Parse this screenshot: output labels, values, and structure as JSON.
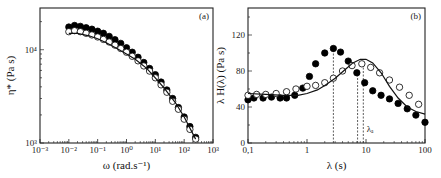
{
  "chart_data": [
    {
      "type": "scatter",
      "panel_label": "(a)",
      "xlabel": "ω (rad.s⁻¹)",
      "ylabel": "η* (Pa s)",
      "xscale": "log",
      "yscale": "log",
      "xlim": [
        0.001,
        1000
      ],
      "ylim": [
        1000,
        28000
      ],
      "x_ticks": [
        "10⁻³",
        "10⁻²",
        "10⁻¹",
        "10⁰",
        "10¹",
        "10²",
        "10³"
      ],
      "y_ticks": [
        "10³",
        "10⁴"
      ],
      "series": [
        {
          "name": "filled circles",
          "marker": "filled-circle",
          "x": [
            0.01,
            0.0158,
            0.0251,
            0.0398,
            0.0631,
            0.1,
            0.158,
            0.251,
            0.398,
            0.631,
            1,
            1.58,
            2.51,
            3.98,
            6.31,
            10,
            15.8,
            25.1,
            39.8,
            63.1,
            100,
            158,
            251
          ],
          "y": [
            17500,
            18200,
            17800,
            17200,
            16600,
            15800,
            15000,
            13900,
            12800,
            11700,
            10500,
            9400,
            8300,
            7300,
            6300,
            5400,
            4500,
            3700,
            3000,
            2400,
            1900,
            1500,
            1150
          ]
        },
        {
          "name": "open circles",
          "marker": "open-circle",
          "x": [
            0.01,
            0.0158,
            0.0251,
            0.0398,
            0.0631,
            0.1,
            0.158,
            0.251,
            0.398,
            0.631,
            1,
            1.58,
            2.51,
            3.98,
            6.31,
            10,
            15.8,
            25.1,
            39.8,
            63.1,
            100,
            158,
            251
          ],
          "y": [
            15600,
            16000,
            15600,
            15000,
            14400,
            13700,
            12900,
            12100,
            11200,
            10300,
            9400,
            8500,
            7600,
            6700,
            5900,
            5000,
            4200,
            3500,
            2800,
            2300,
            1800,
            1400,
            1100
          ]
        },
        {
          "name": "fit line",
          "marker": "line",
          "x": [
            0.01,
            0.02,
            0.05,
            0.1,
            0.2,
            0.5,
            1,
            2,
            5,
            10,
            20,
            50,
            100,
            250
          ],
          "y": [
            15000,
            15000,
            14100,
            13100,
            11900,
            10200,
            9000,
            7900,
            6300,
            5000,
            3900,
            2700,
            1900,
            1100
          ]
        }
      ]
    },
    {
      "type": "scatter",
      "panel_label": "(b)",
      "xlabel": "λ (s)",
      "ylabel": "λ H(λ) (Pa s)",
      "xscale": "log",
      "yscale": "linear",
      "xlim": [
        0.1,
        100
      ],
      "ylim": [
        0,
        150
      ],
      "x_ticks": [
        "0,1",
        "1",
        "10",
        "100"
      ],
      "y_ticks": [
        "0",
        "40",
        "80",
        "120"
      ],
      "annotations": [
        {
          "text": "λₐ",
          "x": 9.5,
          "y": 10
        },
        {
          "type": "vline",
          "x": 2.8,
          "style": "dashed",
          "to_y": 105
        },
        {
          "type": "vline",
          "x": 7.2,
          "style": "dashed",
          "to_y": 80
        },
        {
          "type": "vline",
          "x": 9.0,
          "style": "dashed",
          "to_y": 88
        }
      ],
      "series": [
        {
          "name": "filled circles",
          "marker": "filled-circle",
          "x": [
            0.1,
            0.126,
            0.18,
            0.25,
            0.35,
            0.45,
            0.62,
            0.85,
            1.1,
            1.4,
            2.0,
            2.8,
            3.7,
            5.0,
            7.0,
            9.5,
            13,
            18,
            25,
            35,
            50,
            70,
            100
          ],
          "y": [
            48,
            50,
            50,
            51,
            50,
            50,
            53,
            61,
            74,
            88,
            100,
            105,
            101,
            91,
            78,
            67,
            58,
            53,
            49,
            44,
            38,
            31,
            23
          ]
        },
        {
          "name": "open circles",
          "marker": "open-circle",
          "x": [
            0.1,
            0.14,
            0.2,
            0.3,
            0.45,
            0.65,
            1.0,
            1.4,
            2.0,
            2.8,
            4.0,
            5.8,
            8.5,
            12,
            17,
            25,
            37,
            54,
            78
          ],
          "y": [
            53,
            54,
            54,
            55,
            57,
            60,
            63,
            64,
            67,
            72,
            80,
            86,
            88,
            84,
            78,
            70,
            62,
            53,
            43
          ]
        },
        {
          "name": "fit line",
          "marker": "line",
          "x": [
            0.1,
            0.2,
            0.4,
            0.7,
            1.0,
            1.5,
            2.0,
            3.0,
            4.5,
            6.0,
            8.0,
            10,
            13,
            18,
            25,
            35,
            50,
            70,
            100
          ],
          "y": [
            55,
            54,
            53,
            53,
            55,
            59,
            64,
            72,
            82,
            89,
            93,
            93,
            89,
            78,
            63,
            50,
            40,
            35,
            32
          ]
        }
      ]
    }
  ]
}
